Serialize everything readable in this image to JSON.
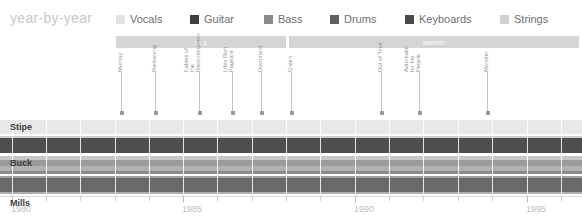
{
  "header": {
    "title": "year-by-year",
    "legend": [
      {
        "label": "Vocals",
        "color": "#e2e2e2",
        "x": 116
      },
      {
        "label": "Guitar",
        "color": "#3f3f3f",
        "x": 190
      },
      {
        "label": "Bass",
        "color": "#8a8a8a",
        "x": 264
      },
      {
        "label": "Drums",
        "color": "#5f5f5f",
        "x": 330
      },
      {
        "label": "Keyboards",
        "color": "#4a4a4a",
        "x": 405
      },
      {
        "label": "Strings",
        "color": "#d0d0d0",
        "x": 500
      }
    ]
  },
  "labels": [
    {
      "name": "i.r.s",
      "x": 116,
      "width": 170,
      "color": "#d5d5d5"
    },
    {
      "name": "warner",
      "x": 289,
      "width": 290,
      "color": "#d5d5d5"
    }
  ],
  "albums": [
    {
      "title": "Murmur",
      "year": 1983,
      "x": 121,
      "lines": 1
    },
    {
      "title": "Reckoning",
      "year": 1984,
      "x": 155,
      "lines": 1
    },
    {
      "title": "Fables of the Reconstruction",
      "year": 1985,
      "x": 199,
      "lines": 2
    },
    {
      "title": "Lifes Rich Pageant",
      "year": 1986,
      "x": 232,
      "lines": 2
    },
    {
      "title": "Document",
      "year": 1987,
      "x": 261,
      "lines": 1
    },
    {
      "title": "Green",
      "year": 1988.7,
      "x": 291,
      "lines": 1
    },
    {
      "title": "Out of Time",
      "year": 1991,
      "x": 381,
      "lines": 1
    },
    {
      "title": "Automatic for the People",
      "year": 1992.7,
      "x": 419,
      "lines": 2
    },
    {
      "title": "Monster",
      "year": 1994.5,
      "x": 487,
      "lines": 1
    }
  ],
  "members": [
    {
      "name": "Stipe",
      "y": 0,
      "height": 18,
      "label_y": 4,
      "bands": [
        {
          "y": 0,
          "height": 2,
          "color": "#ffffff"
        },
        {
          "y": 2,
          "height": 14,
          "color": "#e8e8e8"
        },
        {
          "y": 16,
          "height": 2,
          "color": "#ffffff"
        }
      ]
    },
    {
      "name": "Buck",
      "y": 18,
      "height": 20,
      "label_y": 22,
      "bands": [
        {
          "y": 0,
          "height": 2,
          "color": "#cdcdcd"
        },
        {
          "y": 2,
          "height": 15,
          "color": "#4e4e4e"
        },
        {
          "y": 17,
          "height": 3,
          "color": "#ffffff"
        }
      ]
    },
    {
      "name": "Mills",
      "y": 38,
      "height": 20,
      "label_y": 42,
      "bands": [
        {
          "y": 0,
          "height": 4,
          "color": "#c6c6c6"
        },
        {
          "y": 4,
          "height": 6,
          "color": "#9a9a9a"
        },
        {
          "y": 10,
          "height": 5,
          "color": "#b2b2b2"
        },
        {
          "y": 15,
          "height": 3,
          "color": "#8b8b8b"
        },
        {
          "y": 18,
          "height": 2,
          "color": "#ffffff"
        }
      ]
    },
    {
      "name": "Berry",
      "y": 58,
      "height": 20,
      "label_y": 62,
      "bands": [
        {
          "y": 0,
          "height": 2,
          "color": "#9f9f9f"
        },
        {
          "y": 2,
          "height": 14,
          "color": "#6a6a6a"
        },
        {
          "y": 16,
          "height": 2,
          "color": "#aeaeae"
        },
        {
          "y": 18,
          "height": 2,
          "color": "#ffffff"
        }
      ]
    }
  ],
  "axis": {
    "xmin": 1980,
    "xmax": 1996.6,
    "tick_labels": [
      {
        "text": "1980",
        "x": 12
      },
      {
        "text": "1985",
        "x": 183
      },
      {
        "text": "1990",
        "x": 355
      },
      {
        "text": "1995",
        "x": 527
      }
    ],
    "ticks": [
      12,
      46,
      80,
      115,
      149,
      183,
      217,
      252,
      286,
      320,
      355,
      389,
      423,
      458,
      492,
      527,
      561
    ],
    "major_ticks": [
      12,
      183,
      355,
      527
    ]
  },
  "gridlines": [
    12,
    46,
    80,
    115,
    149,
    183,
    217,
    252,
    286,
    320,
    355,
    389,
    423,
    458,
    492,
    527,
    561
  ],
  "chart_data": {
    "type": "bar",
    "title": "year-by-year",
    "xlabel": "",
    "ylabel": "",
    "xlim": [
      1980,
      1996.6
    ],
    "grid": true,
    "legend_position": "top",
    "categories": [
      "Stipe",
      "Buck",
      "Mills",
      "Berry"
    ],
    "series": [
      {
        "name": "Vocals",
        "color": "#e2e2e2"
      },
      {
        "name": "Guitar",
        "color": "#3f3f3f"
      },
      {
        "name": "Bass",
        "color": "#8a8a8a"
      },
      {
        "name": "Drums",
        "color": "#5f5f5f"
      },
      {
        "name": "Keyboards",
        "color": "#4a4a4a"
      },
      {
        "name": "Strings",
        "color": "#d0d0d0"
      }
    ],
    "annotations": [
      "i.r.s",
      "warner",
      "Murmur",
      "Reckoning",
      "Fables of the Reconstruction",
      "Lifes Rich Pageant",
      "Document",
      "Green",
      "Out of Time",
      "Automatic for the People",
      "Monster"
    ]
  }
}
